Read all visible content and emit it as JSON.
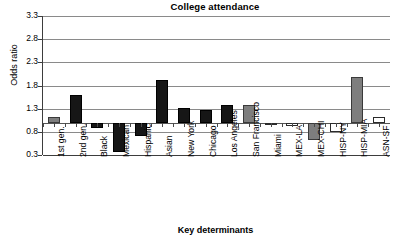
{
  "chart_data": {
    "type": "bar",
    "title": "College attendance",
    "xlabel": "Key determinants",
    "ylabel": "Odds ratio",
    "ylim": [
      0.3,
      3.3
    ],
    "yticks": [
      3.3,
      2.8,
      2.3,
      1.8,
      1.3,
      0.8,
      0.3
    ],
    "ytick_labels": [
      "3.3",
      "2.8",
      "2.3",
      "1.8",
      "1.3",
      "0.8",
      "0.3"
    ],
    "grid": true,
    "legend": "none",
    "reference_line": 1.0,
    "categories": [
      "1st gen.",
      "2nd gen.",
      "Black",
      "Mexican",
      "Hispanic",
      "Asian",
      "New York",
      "Chicago",
      "Los Angeles",
      "San Francisco",
      "Miami",
      "MEX-LA",
      "MEX-CHI",
      "HISP-NY",
      "HISP-MIA",
      "ASN-SF"
    ],
    "values": [
      1.13,
      1.6,
      0.88,
      0.37,
      0.7,
      1.92,
      1.31,
      1.28,
      1.37,
      1.38,
      0.95,
      0.93,
      0.63,
      0.79,
      1.98,
      1.13
    ],
    "fills": [
      "gray",
      "black",
      "black",
      "black",
      "black",
      "black",
      "black",
      "black",
      "black",
      "gray",
      "white",
      "white",
      "gray",
      "white",
      "gray",
      "white"
    ],
    "colors": {
      "black": "#161616",
      "gray": "#7e7e7e",
      "white": "#ffffff",
      "axis": "#3d3d3d",
      "grid": "#8a8a8a"
    }
  }
}
